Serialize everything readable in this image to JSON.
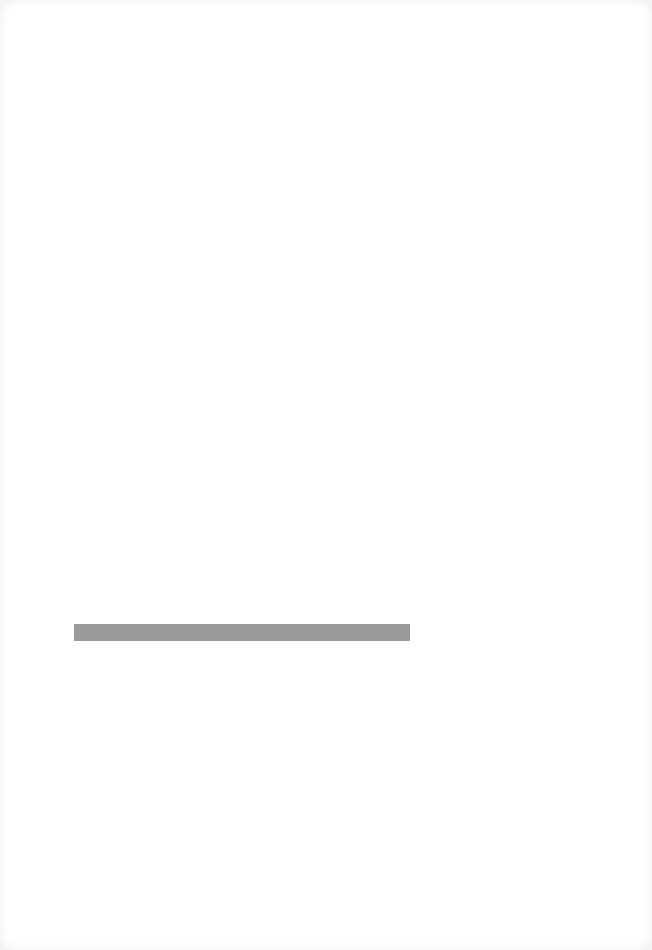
{
  "page": {
    "background": "#ffffff",
    "elements": [
      {
        "type": "horizontal-bar",
        "color": "#9b9b9b",
        "x": 74,
        "y": 624,
        "width": 336,
        "height": 17,
        "text": ""
      }
    ]
  }
}
